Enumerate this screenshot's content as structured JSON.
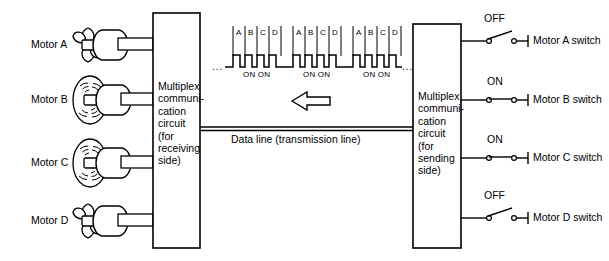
{
  "diagram": {
    "motors": [
      {
        "name": "Motor A",
        "label": "Motor A",
        "state": "stopped",
        "symbol": "propeller-icon"
      },
      {
        "name": "Motor B",
        "label": "Motor B",
        "state": "spinning",
        "symbol": "spinning-fan-icon"
      },
      {
        "name": "Motor C",
        "label": "Motor C",
        "state": "spinning",
        "symbol": "spinning-fan-icon"
      },
      {
        "name": "Motor D",
        "label": "Motor D",
        "state": "stopped",
        "symbol": "propeller-icon"
      }
    ],
    "receiving_box": {
      "lines": [
        "Multiplex",
        "communi-",
        "cation",
        "circuit",
        "(for",
        "receiving",
        "side)"
      ],
      "text": "Multiplex\ncommuni-\ncation\ncircuit\n(for\nreceiving\nside)"
    },
    "sending_box": {
      "lines": [
        "Multiplex",
        "communi-",
        "cation",
        "circuit",
        "(for",
        "sending",
        "side)"
      ],
      "text": "Multiplex\ncommuni-\ncation\ncircuit\n(for\nsending\nside)"
    },
    "data_line": {
      "label": "Data line (transmission line)",
      "direction": "right-to-left",
      "arrow": "left-arrow-icon"
    },
    "switches": [
      {
        "label": "Motor A switch",
        "state": "OFF",
        "closed": false
      },
      {
        "label": "Motor B switch",
        "state": "ON",
        "closed": true
      },
      {
        "label": "Motor C switch",
        "state": "ON",
        "closed": true
      },
      {
        "label": "Motor D switch",
        "state": "OFF",
        "closed": false
      }
    ],
    "waveform": {
      "slot_letters": [
        "A",
        "B",
        "C",
        "D"
      ],
      "frame_count": 3,
      "on_label": "ON ON",
      "on_labels": [
        "ON ON",
        "ON ON",
        "ON ON"
      ],
      "leading_ellipsis": "...",
      "trailing_ellipsis": "...",
      "active_channels": [
        "B",
        "C"
      ],
      "description": "Repeating multiplex frame: slots A B C D; channels B and C are ON"
    },
    "colors": {
      "stroke": "#000000",
      "text": "#000000",
      "background": "#ffffff"
    }
  }
}
